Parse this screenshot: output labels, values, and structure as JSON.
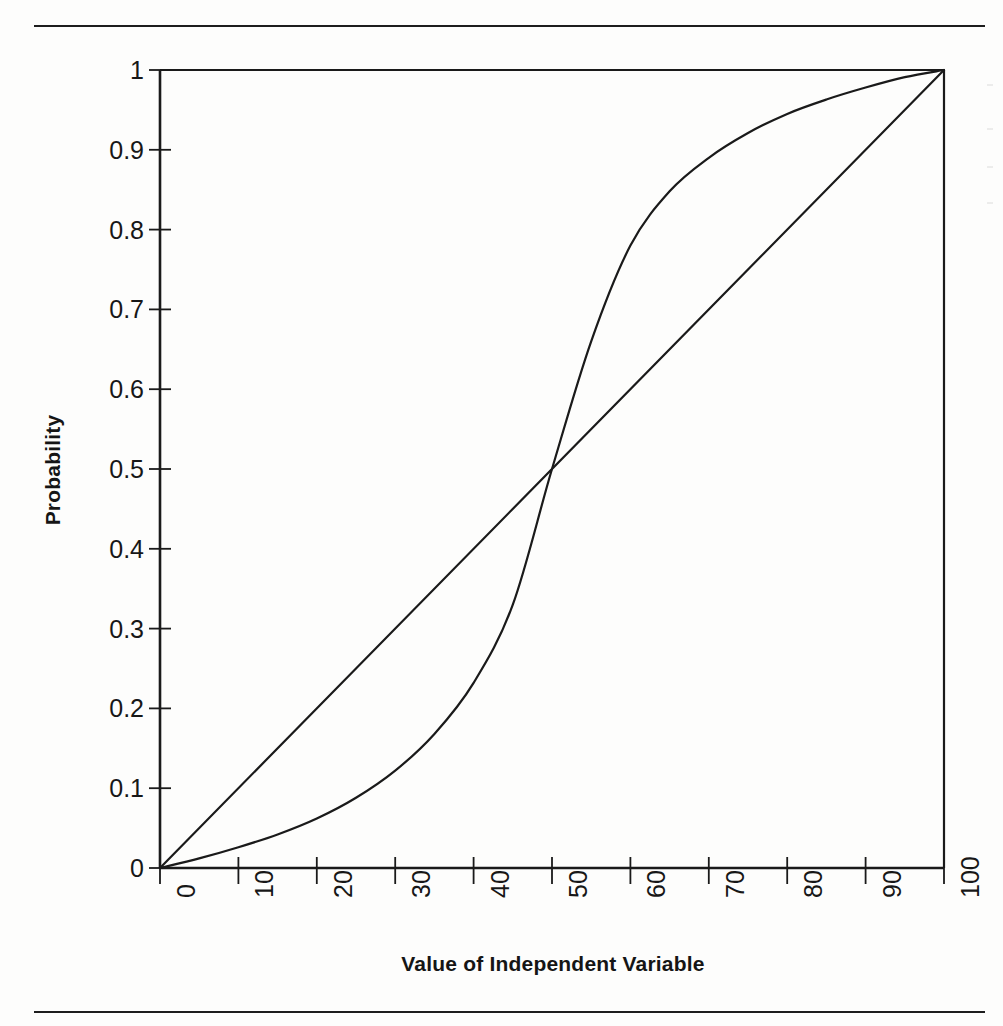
{
  "page": {
    "background": "#fdfdfc",
    "ink": "#151515",
    "top_rule": true,
    "bottom_rule": true
  },
  "chart_data": {
    "type": "line",
    "title": "",
    "xlabel": "Value of Independent Variable",
    "ylabel": "Probability",
    "xlim": [
      0,
      100
    ],
    "ylim": [
      0,
      1
    ],
    "grid": false,
    "legend": "none",
    "xticks": [
      0,
      10,
      20,
      30,
      40,
      50,
      60,
      70,
      80,
      90,
      100
    ],
    "xtick_labels": [
      "0",
      "10",
      "20",
      "30",
      "40",
      "50",
      "60",
      "70",
      "80",
      "90",
      "100"
    ],
    "xtick_label_rotation": -90,
    "yticks": [
      0,
      0.1,
      0.2,
      0.3,
      0.4,
      0.5,
      0.6,
      0.7,
      0.8,
      0.9,
      1
    ],
    "ytick_labels": [
      "0",
      "0.1",
      "0.2",
      "0.3",
      "0.4",
      "0.5",
      "0.6",
      "0.7",
      "0.8",
      "0.9",
      "1"
    ],
    "x": [
      0,
      5,
      10,
      15,
      20,
      25,
      30,
      35,
      40,
      45,
      50,
      55,
      60,
      65,
      70,
      75,
      80,
      85,
      90,
      95,
      100
    ],
    "series": [
      {
        "name": "linear",
        "color": "#1a1a1a",
        "values": [
          0,
          0.05,
          0.1,
          0.15,
          0.2,
          0.25,
          0.3,
          0.35,
          0.4,
          0.45,
          0.5,
          0.55,
          0.6,
          0.65,
          0.7,
          0.75,
          0.8,
          0.85,
          0.9,
          0.95,
          1.0
        ]
      },
      {
        "name": "logistic",
        "color": "#1a1a1a",
        "values": [
          0,
          0.012,
          0.026,
          0.042,
          0.062,
          0.088,
          0.122,
          0.168,
          0.232,
          0.33,
          0.5,
          0.66,
          0.78,
          0.848,
          0.89,
          0.921,
          0.945,
          0.963,
          0.978,
          0.991,
          1.0
        ]
      }
    ],
    "annotations": [
      {
        "text": "curves intersect near x = 51, y = 0.51"
      }
    ]
  },
  "axes": {
    "y_axis_name": "Probability",
    "x_axis_name": "Value of Independent Variable"
  }
}
